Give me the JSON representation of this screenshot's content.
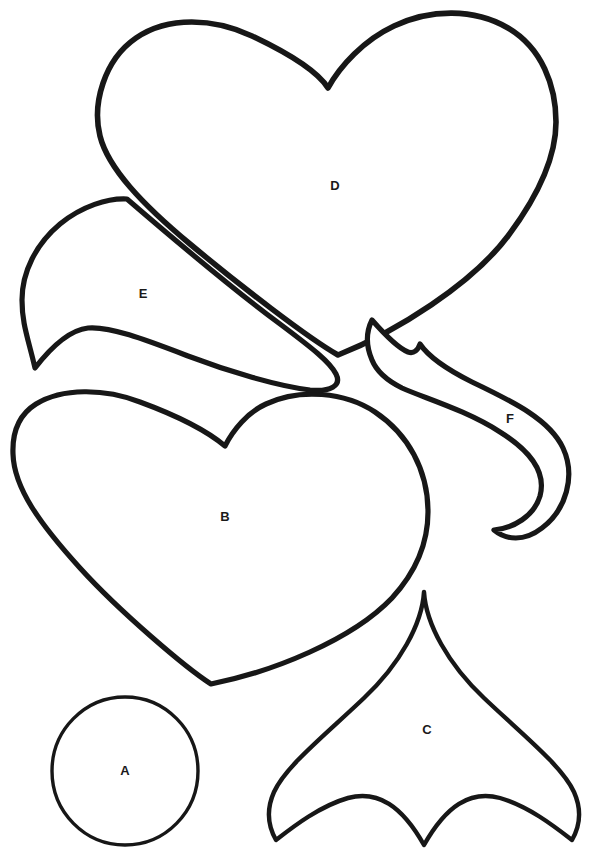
{
  "page": {
    "background_color": "#ffffff",
    "ink_color": "#171717",
    "width": 594,
    "height": 854
  },
  "shapes": [
    {
      "id": "A",
      "label": "A",
      "name": "circle",
      "label_x": 125,
      "label_y": 770,
      "stroke_width": 3.4,
      "path": "M 198 771 C 198 811.9 165.3 845 125 845 C 84.7 845 52 811.9 52 771 C 52 730.1 84.7 697 125 697 C 165.3 697 198 730.1 198 771 Z"
    },
    {
      "id": "B",
      "label": "B",
      "name": "heart-medium",
      "label_x": 225,
      "label_y": 516,
      "stroke_width": 5.2,
      "path": "M 225 446 C 233 430 248 412 266 404 C 300 388 345 392 375 412 C 408 434 428 470 428 512 C 428 545 414 574 392 598 C 352 640 272 672 211 684 C 186 668 120 612 80 568 C 40 524 14 488 13 454 C 12 430 20 414 36 404 C 62 388 104 388 140 402 C 178 416 206 430 225 446 Z"
    },
    {
      "id": "C",
      "label": "C",
      "name": "ogee-spade",
      "label_x": 427,
      "label_y": 729,
      "stroke_width": 4.4,
      "path": "M 424 592 C 426 624 448 664 484 698 C 524 736 562 766 574 792 C 582 810 580 826 572 840 C 554 826 528 806 500 798 C 470 790 446 806 424 845 C 402 806 378 790 348 798 C 320 806 294 826 276 840 C 268 826 266 810 274 792 C 286 766 324 736 364 698 C 400 664 422 624 424 592 Z"
    },
    {
      "id": "D",
      "label": "D",
      "name": "heart-large",
      "label_x": 335,
      "label_y": 185,
      "stroke_width": 5.6,
      "path": "M 328 88 C 340 66 364 40 394 26 C 430 9 474 8 508 28 C 542 48 556 86 556 122 C 556 158 538 196 508 236 C 472 284 396 332 338 355 C 308 338 238 284 190 244 C 142 204 108 168 100 136 C 92 104 104 60 136 38 C 168 16 214 18 252 36 C 290 54 318 72 328 88 Z"
    },
    {
      "id": "E",
      "label": "E",
      "name": "petal-leaf",
      "label_x": 143,
      "label_y": 293,
      "stroke_width": 5.2,
      "path": "M 127 199 C 170 236 234 290 280 324 C 312 348 330 362 336 374 C 342 386 330 392 310 390 C 278 386 230 372 188 356 C 146 340 110 326 88 328 C 70 330 52 346 35 368 C 28 338 22 324 22 300 C 22 272 36 244 60 224 C 82 206 108 198 127 199 Z"
    },
    {
      "id": "F",
      "label": "F",
      "name": "crescent-flame",
      "label_x": 510,
      "label_y": 418,
      "stroke_width": 5.2,
      "path": "M 372 320 C 386 336 398 348 408 352 C 414 354 418 350 420 344 C 428 356 444 368 472 382 C 514 402 550 420 563 448 C 576 476 566 510 542 528 C 524 542 506 540 494 530 C 514 528 534 516 540 496 C 546 474 532 452 500 432 C 466 410 424 398 402 388 C 386 380 376 370 372 360 C 366 346 366 332 372 320 Z"
    }
  ]
}
